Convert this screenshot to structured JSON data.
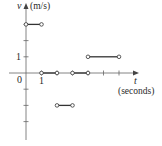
{
  "chart_data": {
    "type": "line",
    "subtype": "step-function",
    "title": "",
    "xlabel": "t",
    "xlabel_unit": "(seconds)",
    "ylabel": "v",
    "ylabel_unit": "(m/s)",
    "x_tick_labels": [
      "0",
      "1"
    ],
    "y_tick_labels": [
      "1"
    ],
    "xlim": [
      0,
      6.5
    ],
    "ylim": [
      -3.5,
      3.5
    ],
    "grid": false,
    "segments": [
      {
        "x_start": 0,
        "x_end": 1,
        "y": 3,
        "start_open": true,
        "end_open": true
      },
      {
        "x_start": 1,
        "x_end": 2,
        "y": 0,
        "start_open": true,
        "end_open": true
      },
      {
        "x_start": 2,
        "x_end": 3,
        "y": -2,
        "start_open": true,
        "end_open": true
      },
      {
        "x_start": 3,
        "x_end": 4,
        "y": 0,
        "start_open": true,
        "end_open": true
      },
      {
        "x_start": 4,
        "x_end": 6,
        "y": 1,
        "start_open": true,
        "end_open": true
      }
    ],
    "colors": {
      "line": "#333333",
      "axis": "#555555"
    }
  },
  "labels": {
    "y_axis_var": "v",
    "y_axis_unit": "(m/s)",
    "x_axis_var": "t",
    "x_axis_unit": "(seconds)",
    "origin": "0",
    "x_one": "1",
    "y_one": "1"
  }
}
